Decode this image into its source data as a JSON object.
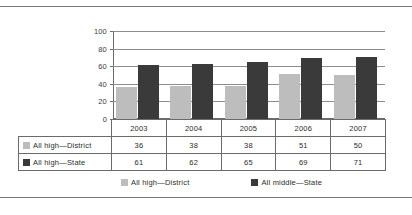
{
  "page": {
    "cropped_header_text": "All high—District            All middle—State"
  },
  "chart_data": {
    "type": "bar",
    "title": "",
    "xlabel": "",
    "ylabel": "",
    "categories": [
      "2003",
      "2004",
      "2005",
      "2006",
      "2007"
    ],
    "series": [
      {
        "name": "All high—District",
        "values": [
          36,
          38,
          38,
          51,
          50
        ],
        "color": "#bdbdbd"
      },
      {
        "name": "All high—State",
        "values": [
          61,
          62,
          65,
          69,
          71
        ],
        "color": "#3a3a3a"
      }
    ],
    "ylim": [
      0,
      100
    ],
    "yticks": [
      100,
      80,
      60,
      40,
      20,
      0
    ],
    "grid": true,
    "legend_position": "bottom",
    "legend_entries": [
      {
        "label": "All high—District",
        "color": "#bdbdbd"
      },
      {
        "label": "All middle—State",
        "color": "#3a3a3a"
      }
    ]
  },
  "table": {
    "header_row": [
      "",
      "2003",
      "2004",
      "2005",
      "2006",
      "2007"
    ],
    "rows": [
      {
        "label": "All high—District",
        "swatch": "#bdbdbd",
        "values": [
          "36",
          "38",
          "38",
          "51",
          "50"
        ]
      },
      {
        "label": "All high—State",
        "swatch": "#3a3a3a",
        "values": [
          "61",
          "62",
          "65",
          "69",
          "71"
        ]
      }
    ]
  }
}
